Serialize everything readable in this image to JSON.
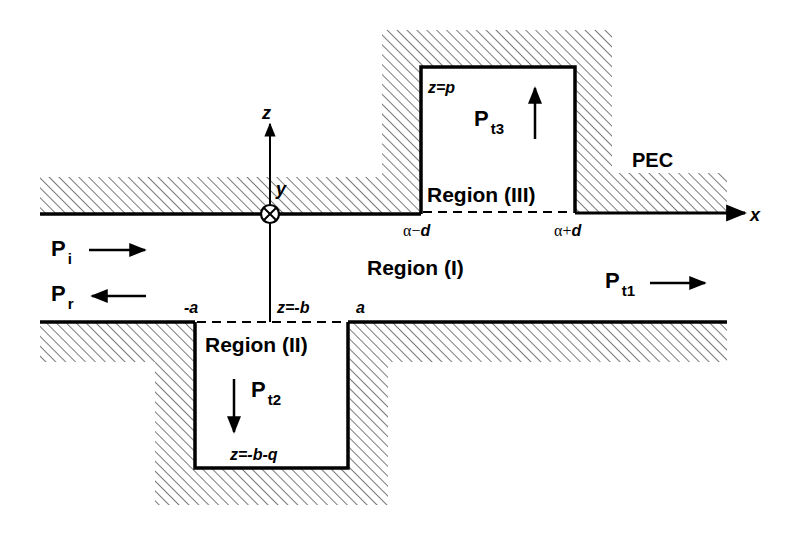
{
  "diagram": {
    "type": "waveguide cross-section with two rectangular grooves",
    "material_label": "PEC",
    "axes": {
      "x": "x",
      "z": "z",
      "y": "y",
      "y_symbol": "⊗"
    },
    "regions": [
      {
        "id": "I",
        "label": "Region (I)"
      },
      {
        "id": "II",
        "label": "Region (II)"
      },
      {
        "id": "III",
        "label": "Region (III)"
      }
    ],
    "powers": {
      "incident": {
        "base": "P",
        "sub": "i"
      },
      "reflected": {
        "base": "P",
        "sub": "r"
      },
      "transmitted_1": {
        "base": "P",
        "sub": "t1"
      },
      "transmitted_2": {
        "base": "P",
        "sub": "t2"
      },
      "transmitted_3": {
        "base": "P",
        "sub": "t3"
      }
    },
    "boundary_labels": {
      "lower_left": "-a",
      "lower_right": "a",
      "lower_wall": "z=-b",
      "groove_bottom": "z=-b-q",
      "groove_top": "z=p",
      "upper_left_greek": "α−",
      "upper_left_var": "d",
      "upper_right_greek": "α+",
      "upper_right_var": "d"
    },
    "colors": {
      "line": "#000000",
      "background": "#ffffff",
      "hatch": "#333333"
    }
  }
}
